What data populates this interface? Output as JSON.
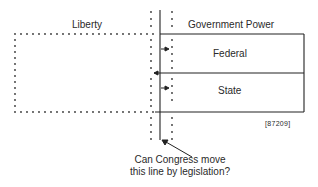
{
  "diagram": {
    "regions": {
      "liberty_label": "Liberty",
      "government_label": "Government Power",
      "federal_label": "Federal",
      "state_label": "State"
    },
    "reference_code": "[87209]",
    "question": {
      "line1": "Can Congress move",
      "line2": "this line by legislation?"
    },
    "colors": {
      "line": "#222222",
      "dots": "#333333",
      "background": "#ffffff"
    }
  }
}
